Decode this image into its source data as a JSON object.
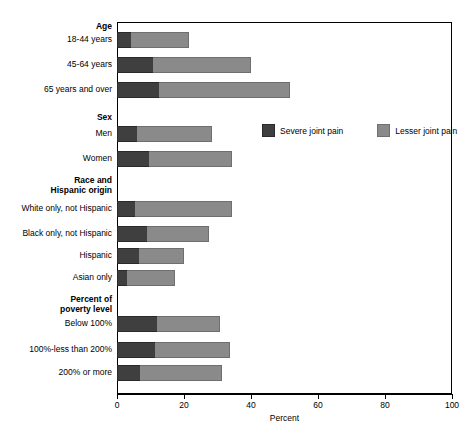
{
  "chart_data": {
    "type": "bar",
    "orientation": "horizontal",
    "stacked": true,
    "title": "",
    "xlabel": "Percent",
    "ylabel": "",
    "xlim": [
      0,
      100
    ],
    "xticks": [
      0,
      20,
      40,
      60,
      80,
      100
    ],
    "xtick_labels": [
      "0",
      "20",
      "40",
      "60",
      "80",
      "100"
    ],
    "grid": false,
    "legend_position": "upper right inside",
    "series": [
      {
        "name": "Severe joint pain",
        "color": "#3f3f3f",
        "values": [
          4.2,
          10.6,
          12.4,
          6.0,
          9.5,
          5.3,
          9.0,
          6.6,
          3.0,
          12.0,
          11.2,
          6.9
        ]
      },
      {
        "name": "Lesser joint pain",
        "color": "#8a8a8a",
        "values": [
          17.2,
          29.4,
          39.1,
          22.4,
          24.8,
          29.0,
          18.4,
          13.4,
          14.3,
          18.8,
          22.5,
          24.4
        ]
      }
    ],
    "categories": [
      "18-44 years",
      "45-64 years",
      "65 years and over",
      "Men",
      "Women",
      "White only, not Hispanic",
      "Black only, not Hispanic",
      "Hispanic",
      "Asian only",
      "Below 100%",
      "100%-less than 200%",
      "200% or more"
    ],
    "group_headers": [
      "Age",
      "Sex",
      "Race and Hispanic origin",
      "Percent of poverty level"
    ],
    "totals": [
      21.4,
      40.0,
      51.5,
      28.4,
      34.3,
      34.3,
      27.4,
      20.0,
      17.3,
      30.8,
      33.7,
      31.3
    ]
  },
  "legend": {
    "items": [
      {
        "label": "Severe joint pain",
        "color": "#3f3f3f"
      },
      {
        "label": "Lesser joint pain",
        "color": "#8a8a8a"
      }
    ]
  },
  "axis": {
    "title": "Percent",
    "ticks": [
      "0",
      "20",
      "40",
      "60",
      "80",
      "100"
    ]
  },
  "rows": [
    {
      "type": "header",
      "label": "Age"
    },
    {
      "type": "bar",
      "label": "18-44 years",
      "severe": 4.2,
      "total": 21.4
    },
    {
      "type": "bar",
      "label": "45-64 years",
      "severe": 10.6,
      "total": 40.0
    },
    {
      "type": "bar",
      "label": "65 years and over",
      "severe": 12.4,
      "total": 51.5
    },
    {
      "type": "header",
      "label": "Sex"
    },
    {
      "type": "bar",
      "label": "Men",
      "severe": 6.0,
      "total": 28.4
    },
    {
      "type": "bar",
      "label": "Women",
      "severe": 9.5,
      "total": 34.3
    },
    {
      "type": "header2",
      "label1": "Race and",
      "label2": "Hispanic origin"
    },
    {
      "type": "bar",
      "label": "White only, not Hispanic",
      "severe": 5.3,
      "total": 34.3
    },
    {
      "type": "bar",
      "label": "Black only, not Hispanic",
      "severe": 9.0,
      "total": 27.4
    },
    {
      "type": "bar",
      "label": "Hispanic",
      "severe": 6.6,
      "total": 20.0
    },
    {
      "type": "bar",
      "label": "Asian only",
      "severe": 3.0,
      "total": 17.3
    },
    {
      "type": "header2",
      "label1": "Percent of",
      "label2": "poverty level"
    },
    {
      "type": "bar",
      "label": "Below 100%",
      "severe": 12.0,
      "total": 30.8
    },
    {
      "type": "bar",
      "label": "100%-less than 200%",
      "severe": 11.2,
      "total": 33.7
    },
    {
      "type": "bar",
      "label": "200% or more",
      "severe": 6.9,
      "total": 31.3
    }
  ]
}
